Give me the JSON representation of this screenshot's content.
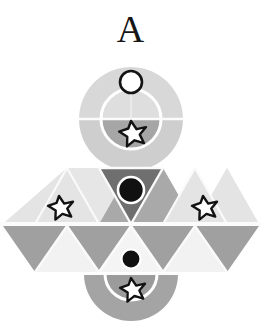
{
  "figure": {
    "label": "A",
    "canvas": {
      "width": 261,
      "height": 331,
      "background": "#ffffff"
    },
    "palette": {
      "background": "#ffffff",
      "very_light_gray": "#e2e2e2",
      "light_gray": "#d6d6d6",
      "mid_light_gray": "#c9c9c9",
      "mid_gray": "#a8a8a8",
      "dark_gray": "#8a8a8a",
      "darker_gray": "#6e6e6e",
      "black": "#111111",
      "white": "#ffffff",
      "separator": "#f7f7f7"
    },
    "parts": {
      "top_ring": {
        "name": "outer-ring",
        "center_x": 131,
        "center_y": 119,
        "outer_radius": 52,
        "inner_radius": 30,
        "top_half_color": "#d6d6d6",
        "bottom_half_color": "#cdcdcd"
      },
      "top_inner_disc": {
        "name": "inner-disc",
        "center_x": 131,
        "center_y": 119,
        "radius": 30,
        "top_half_color": "#dcdcdc",
        "bottom_half_color": "#a6a6a6"
      },
      "top_small_circle": {
        "name": "small-open-circle",
        "center_x": 131,
        "center_y": 82,
        "radius": 11,
        "fill": "#ffffff",
        "stroke": "#111111",
        "stroke_width": 2.6
      },
      "top_star": {
        "name": "top-star",
        "center_x": 131,
        "center_y": 133,
        "radius": 13,
        "fill": "#ffffff",
        "stroke": "#111111",
        "stroke_width": 2.4
      },
      "triangle_band": {
        "name": "triangle-band",
        "rows": 2,
        "row1_top_y": 168,
        "row_height": 56,
        "row2_top_y": 225,
        "band_bottom_y": 272,
        "cell_half_width": 32
      },
      "dark_down_triangle": {
        "name": "dark-inverted-triangle",
        "fill": "#6e6e6e",
        "circle": {
          "center_x": 131,
          "center_y": 190,
          "radius": 13,
          "fill": "#111111",
          "stroke": "#ffffff",
          "stroke_width": 2.5
        }
      },
      "lower_circle": {
        "name": "lower-small-circle",
        "center_x": 131,
        "center_y": 259,
        "radius": 9,
        "fill": "#111111",
        "stroke": "#ffffff",
        "stroke_width": 2.2
      },
      "left_star": {
        "name": "left-star",
        "center_x": 59,
        "center_y": 208,
        "radius": 13,
        "fill": "#ffffff",
        "stroke": "#111111",
        "stroke_width": 2.4
      },
      "right_star": {
        "name": "right-star",
        "center_x": 203,
        "center_y": 208,
        "radius": 13,
        "fill": "#ffffff",
        "stroke": "#111111",
        "stroke_width": 2.4
      },
      "bottom_half_disc": {
        "name": "bottom-half-disc",
        "center_x": 131,
        "flat_top_y": 274,
        "outer_radius": 47,
        "inner_radius": 26,
        "outer_fill": "#a3a3a3",
        "inner_fill": "#9a9a9a"
      },
      "bottom_star": {
        "name": "bottom-star",
        "center_x": 131,
        "center_y": 290,
        "radius": 12,
        "fill": "#ffffff",
        "stroke": "#111111",
        "stroke_width": 2.3
      }
    }
  }
}
